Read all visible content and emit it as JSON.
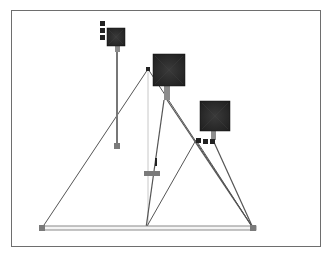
{
  "canvas": {
    "width": 330,
    "height": 255,
    "background": "#ffffff"
  },
  "frame": {
    "x": 11,
    "y": 10,
    "width": 309,
    "height": 236,
    "stroke": "#6e6e6e"
  },
  "colors": {
    "line": "#555555",
    "light_line": "#c8c8c8",
    "beam": "#8a8a8a",
    "joint": "#7a7a7a",
    "weight_dark": "#1e1e1e",
    "weight_mid": "#3a3a3a",
    "stem": "#8c8c8c",
    "marker": "#222222"
  },
  "beam": {
    "x1": 40,
    "x2": 256,
    "y_top": 226,
    "y_bottom": 230
  },
  "joints": [
    {
      "name": "left-base-joint",
      "x": 39,
      "y": 225,
      "size": 6
    },
    {
      "name": "right-base-joint",
      "x": 250,
      "y": 225,
      "size": 6
    }
  ],
  "triangles": [
    {
      "name": "main-triangle",
      "apex": [
        148,
        69
      ],
      "left": [
        42,
        228
      ],
      "right": [
        253,
        228
      ]
    },
    {
      "name": "inner-triangle",
      "apex": [
        196,
        140
      ],
      "left": [
        146,
        228
      ],
      "right": [
        253,
        228
      ]
    }
  ],
  "plumb_line": {
    "x": 148,
    "y1": 69,
    "y2": 228
  },
  "weights": [
    {
      "name": "weight-left",
      "x": 107,
      "y": 28,
      "size": 18,
      "stem": {
        "x": 115,
        "y1": 46,
        "y2": 52,
        "w": 5
      },
      "rod": {
        "x": 117,
        "y1": 52,
        "y2": 144
      },
      "foot": {
        "x": 114,
        "y": 143,
        "w": 6,
        "h": 6
      },
      "markers": [
        {
          "x": 100,
          "y": 21
        },
        {
          "x": 100,
          "y": 28
        },
        {
          "x": 100,
          "y": 35
        }
      ]
    },
    {
      "name": "weight-top",
      "x": 153,
      "y": 54,
      "size": 32,
      "stem": {
        "x": 164,
        "y1": 86,
        "y2": 100,
        "w": 6
      },
      "markers": []
    },
    {
      "name": "weight-right",
      "x": 200,
      "y": 101,
      "size": 30,
      "stem": {
        "x": 211,
        "y1": 131,
        "y2": 140,
        "w": 5
      },
      "markers": [
        {
          "x": 196,
          "y": 138
        },
        {
          "x": 203,
          "y": 139
        },
        {
          "x": 210,
          "y": 139
        }
      ]
    }
  ],
  "apex_marker": {
    "x": 146,
    "y": 67,
    "size": 4
  },
  "slider": {
    "block": {
      "x": 144,
      "y": 171,
      "w": 16,
      "h": 5
    },
    "bar": {
      "x": 155,
      "y": 158,
      "w": 2,
      "h": 8
    }
  },
  "rods": [
    {
      "name": "rod-top-to-right",
      "x1": 167,
      "y1": 100,
      "x2": 253,
      "y2": 228
    },
    {
      "name": "rod-right-weight",
      "x1": 213,
      "y1": 140,
      "x2": 253,
      "y2": 228
    },
    {
      "name": "rod-top-to-inner",
      "x1": 164,
      "y1": 100,
      "x2": 146,
      "y2": 228
    }
  ]
}
